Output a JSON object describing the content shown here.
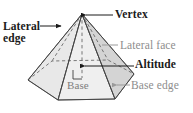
{
  "figure": {
    "shape_name": "hexagonal-pyramid",
    "colors": {
      "dark_text": "#1a1a1a",
      "gray_text": "#8d8d8d",
      "face_fill_light": "#e6e6e6",
      "face_fill_dark": "#d2d2d2",
      "base_fill": "#e0e0e0",
      "outline": "#3c3c3c",
      "leader_dark": "#1a1a1a",
      "leader_gray": "#9a9a9a",
      "background": "#ffffff"
    }
  },
  "labels": {
    "lateral_edge": {
      "line1": "Lateral",
      "line2": "edge",
      "style": "dark",
      "leader": "arrow-right"
    },
    "vertex": {
      "text": "Vertex",
      "style": "dark",
      "leader": "arrow-left"
    },
    "lateral_face": {
      "text": "Lateral face",
      "style": "gray",
      "leader": "plain-line"
    },
    "altitude": {
      "text": "Altitude",
      "style": "dark",
      "leader": "arrow-left"
    },
    "base_edge": {
      "text": "Base edge",
      "style": "gray",
      "leader": "arrow-left"
    },
    "base": {
      "text": "Base",
      "style": "gray",
      "leader": "bracket"
    }
  },
  "geometry": {
    "apex": [
      82,
      14
    ],
    "base_vertices": [
      [
        28,
        80
      ],
      [
        58,
        100
      ],
      [
        115,
        99
      ],
      [
        134,
        74
      ],
      [
        108,
        60
      ],
      [
        52,
        61
      ]
    ],
    "base_center": [
      82,
      78
    ],
    "altitude_foot": [
      82,
      78
    ],
    "right_angle_marker": true,
    "hidden_edges": [
      "apex-to-back-left",
      "apex-to-back-right",
      "altitude",
      "back-base-edges"
    ]
  }
}
